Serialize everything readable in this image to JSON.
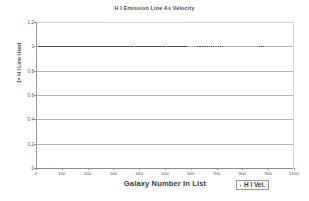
{
  "chart_data": {
    "type": "scatter",
    "title": "H I Emission Line As Velocity",
    "xlabel": "Galaxy Number In List",
    "ylabel": "1= H I Line Used",
    "xlim": [
      0,
      1000
    ],
    "ylim": [
      0,
      1.2
    ],
    "grid": true,
    "legend_position": "bottom-right",
    "x_ticks": [
      0,
      100,
      200,
      300,
      400,
      500,
      600,
      700,
      800,
      900,
      1000
    ],
    "x_tick_labels": [
      "0",
      "100",
      "200",
      "300",
      "400",
      "500",
      "600",
      "700",
      "800",
      "900",
      "1000"
    ],
    "y_ticks": [
      0,
      0.2,
      0.4,
      0.6,
      0.8,
      1,
      1.2
    ],
    "y_tick_labels": [
      "0",
      "0.2",
      "0.4",
      "0.6",
      "0.8",
      "1",
      "1.2"
    ],
    "series": [
      {
        "name": "H I Vel.",
        "marker": "small-square",
        "color": "#4d4d57",
        "x": [
          4,
          7,
          9,
          12,
          15,
          17,
          20,
          23,
          26,
          29,
          31,
          34,
          36,
          39,
          41,
          44,
          46,
          49,
          52,
          55,
          57,
          60,
          62,
          64,
          66,
          68,
          70,
          72,
          74,
          76,
          78,
          80,
          82,
          84,
          86,
          88,
          90,
          92,
          94,
          96,
          98,
          100,
          102,
          104,
          106,
          108,
          110,
          112,
          114,
          116,
          118,
          120,
          122,
          124,
          126,
          128,
          130,
          132,
          134,
          136,
          138,
          140,
          142,
          144,
          146,
          148,
          150,
          152,
          154,
          156,
          158,
          160,
          162,
          164,
          166,
          168,
          170,
          172,
          174,
          176,
          178,
          180,
          183,
          186,
          189,
          192,
          195,
          198,
          201,
          204,
          207,
          210,
          213,
          216,
          219,
          222,
          225,
          228,
          231,
          234,
          237,
          240,
          243,
          246,
          249,
          252,
          255,
          258,
          261,
          264,
          267,
          270,
          274,
          278,
          282,
          286,
          290,
          294,
          298,
          302,
          306,
          310,
          314,
          318,
          322,
          326,
          330,
          334,
          338,
          342,
          346,
          350,
          354,
          358,
          362,
          366,
          370,
          374,
          378,
          382,
          386,
          390,
          394,
          398,
          402,
          406,
          410,
          414,
          418,
          422,
          426,
          430,
          434,
          438,
          442,
          446,
          450,
          454,
          458,
          462,
          466,
          470,
          474,
          478,
          482,
          486,
          490,
          494,
          498,
          502,
          506,
          510,
          514,
          518,
          522,
          526,
          530,
          534,
          538,
          542,
          546,
          550,
          554,
          558,
          562,
          566,
          570,
          574,
          578,
          620,
          626,
          632,
          638,
          645,
          652,
          660,
          668,
          676,
          684,
          700,
          708,
          716,
          860,
          868,
          876
        ],
        "y_constant": 1,
        "note": "All plotted points have value 1 (H I line used)"
      }
    ]
  },
  "legend": {
    "entries": [
      {
        "label": "H I Vel.",
        "marker": "small-square"
      }
    ]
  }
}
